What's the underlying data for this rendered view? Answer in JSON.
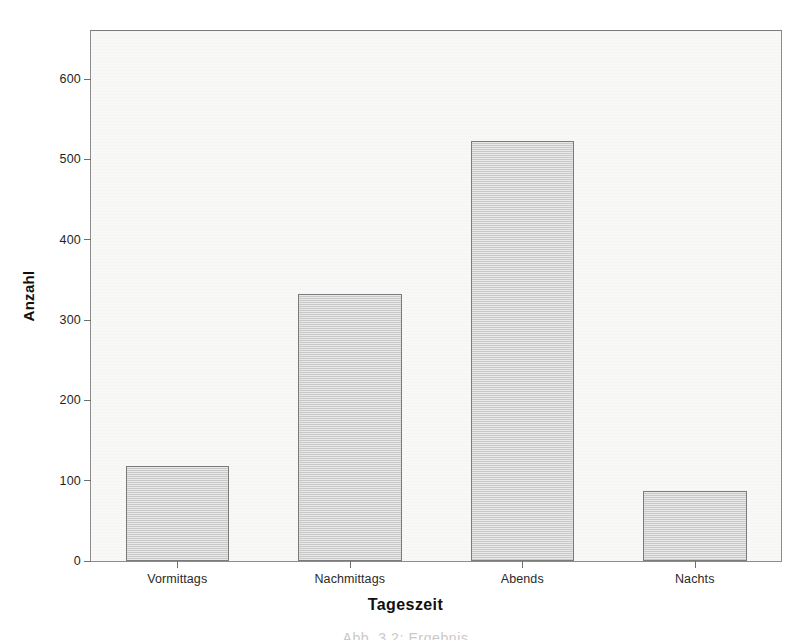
{
  "chart_data": {
    "type": "bar",
    "title": "",
    "subtitle": "",
    "xlabel": "Tageszeit",
    "ylabel": "Anzahl",
    "categories": [
      "Vormittags",
      "Nachmittags",
      "Abends",
      "Nachts"
    ],
    "values": [
      118,
      332,
      523,
      87
    ],
    "series": [
      {
        "name": "Anzahl",
        "values": [
          118,
          332,
          523,
          87
        ]
      }
    ],
    "ylim": [
      0,
      660
    ],
    "yticks": [
      0,
      100,
      200,
      300,
      400,
      500,
      600
    ],
    "ytick_labels": [
      "0",
      "100",
      "200",
      "300",
      "400",
      "500",
      "600"
    ],
    "grid": false,
    "legend": false,
    "legend_position": "none",
    "bar_fill_color": "#cfcfcf",
    "bar_border_color": "#7b7b7b",
    "plot_background_color": "#f8f8f6",
    "axis_color": "#6e6e6e",
    "text_color": "#1d1d1d"
  },
  "axes": {
    "y_title": "Anzahl",
    "x_title": "Tageszeit"
  },
  "caption": {
    "text": "Abb. 3.2: Ergebnis"
  }
}
